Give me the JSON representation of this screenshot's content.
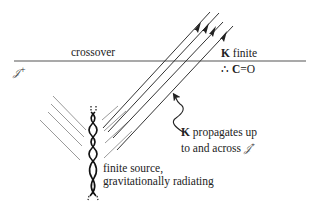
{
  "diagram": {
    "scri_plus": {
      "symbol": "𝒥",
      "sup": "+"
    },
    "crossover_label": "crossover",
    "k_finite": {
      "symbol": "K",
      "text": " finite"
    },
    "therefore": {
      "prefix": "∴ ",
      "symbol": "C",
      "text": "=O"
    },
    "propagates": {
      "symbol": "K",
      "line1_text": " propagates up",
      "line2_text": "to and across ",
      "line2_scri": "𝒥",
      "line2_sup": "+"
    },
    "source": {
      "line1": "finite source,",
      "line2": "gravitationally radiating"
    },
    "colors": {
      "scri_line": "#555555",
      "outgoing_rays": "#333333",
      "incoming_rays": "#9a9a9a",
      "braid": "#111111"
    }
  }
}
